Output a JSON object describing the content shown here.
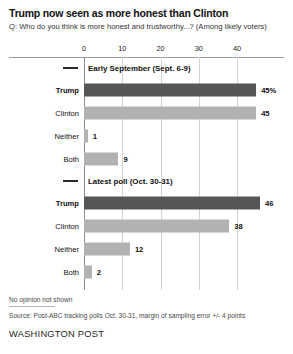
{
  "headline": "Trump now seen as more honest than Clinton",
  "subhead": "Q: Who do you think is more honest and trustworthy...? (Among likely voters)",
  "footer": {
    "note": "No opinion not shown",
    "source": "Source: Post-ABC tracking polls Oct. 30-31, margin of sampling error +/- 4 points",
    "brand": "WASHINGTON POST"
  },
  "colors": {
    "trump_bar": "#565656",
    "other_bar": "#b2b2b2",
    "gridline": "#d2d2d2",
    "axis": "#8e8e8e"
  },
  "chart_data": {
    "type": "bar",
    "orientation": "horizontal",
    "title": "Trump now seen as more honest than Clinton",
    "subtitle": "Q: Who do you think is more honest and trustworthy...? (Among likely voters)",
    "xlabel": "",
    "ylabel": "",
    "xlim": [
      0,
      46
    ],
    "xticks": [
      0,
      10,
      20,
      30,
      40
    ],
    "xtick_labels": [
      "0",
      "10",
      "20",
      "30",
      "40"
    ],
    "grid": true,
    "legend": "none",
    "groups": [
      {
        "name": "Early September (Sept. 6-9)",
        "categories": [
          "Trump",
          "Clinton",
          "Neither",
          "Both"
        ],
        "values": [
          45,
          45,
          1,
          9
        ],
        "value_labels": [
          "45%",
          "45",
          "1",
          "9"
        ],
        "bar_styles": [
          "dark",
          "light",
          "light",
          "light"
        ]
      },
      {
        "name": "Latest poll (Oct. 30-31)",
        "categories": [
          "Trump",
          "Clinton",
          "Neither",
          "Both"
        ],
        "values": [
          46,
          38,
          12,
          2
        ],
        "value_labels": [
          "46",
          "38",
          "12",
          "2"
        ],
        "bar_styles": [
          "dark",
          "light",
          "light",
          "light"
        ]
      }
    ]
  }
}
